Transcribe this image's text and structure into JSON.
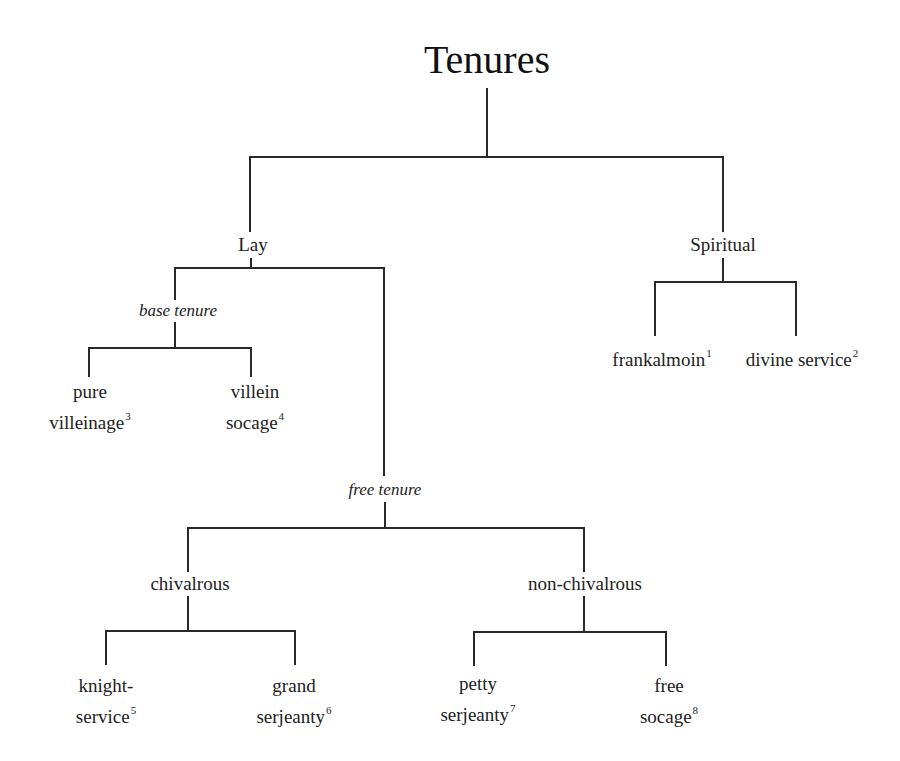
{
  "diagram": {
    "title": "Tenures",
    "nodes": {
      "lay": "Lay",
      "spiritual": "Spiritual",
      "base_tenure": "base tenure",
      "free_tenure": "free tenure",
      "chivalrous": "chivalrous",
      "non_chivalrous": "non-chivalrous"
    },
    "leaves": {
      "frankalmoin": {
        "line1": "frankalmoin",
        "note": "1"
      },
      "divine_service": {
        "line1": "divine service",
        "note": "2"
      },
      "pure_villeinage": {
        "line1": "pure",
        "line2": "villeinage",
        "note": "3"
      },
      "villein_socage": {
        "line1": "villein",
        "line2": "socage",
        "note": "4"
      },
      "knight_service": {
        "line1": "knight-",
        "line2": "service",
        "note": "5"
      },
      "grand_serjeanty": {
        "line1": "grand",
        "line2": "serjeanty",
        "note": "6"
      },
      "petty_serjeanty": {
        "line1": "petty",
        "line2": "serjeanty",
        "note": "7"
      },
      "free_socage": {
        "line1": "free",
        "line2": "socage",
        "note": "8"
      }
    },
    "structure": {
      "Tenures": [
        "Lay",
        "Spiritual"
      ],
      "Lay": [
        "base tenure",
        "free tenure"
      ],
      "base tenure": [
        "pure villeinage",
        "villein socage"
      ],
      "free tenure": [
        "chivalrous",
        "non-chivalrous"
      ],
      "chivalrous": [
        "knight-service",
        "grand serjeanty"
      ],
      "non-chivalrous": [
        "petty serjeanty",
        "free socage"
      ],
      "Spiritual": [
        "frankalmoin",
        "divine service"
      ]
    },
    "line_color": "#2a2a2a",
    "text_color": "#222222",
    "background": "#ffffff"
  }
}
